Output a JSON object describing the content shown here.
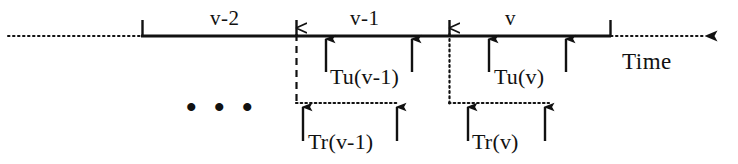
{
  "figure": {
    "axis": {
      "label": "Time",
      "label_x": 622,
      "label_y": 62,
      "baseline_y": 36,
      "solid_start_x": 142,
      "solid_end_x": 610,
      "dotted_left_start_x": 8,
      "dotted_right_end_x": 718,
      "stroke_color": "#111111"
    },
    "ticks": [
      {
        "name": "tick-start",
        "x": 142,
        "top_y": 21,
        "bottom_y": 37
      },
      {
        "name": "tick-v-2-end",
        "x": 296,
        "top_y": 21,
        "bottom_y": 37
      },
      {
        "name": "tick-v-1-end",
        "x": 449,
        "top_y": 21,
        "bottom_y": 37
      },
      {
        "name": "tick-v-end",
        "x": 610,
        "top_y": 21,
        "bottom_y": 37
      }
    ],
    "periods": [
      {
        "name": "period-v-minus-2",
        "label": "v-2",
        "center_x": 232,
        "y": 8
      },
      {
        "name": "period-v-minus-1",
        "label": "v-1",
        "center_x": 372,
        "y": 8
      },
      {
        "name": "period-v",
        "label": "v",
        "center_x": 510,
        "y": 8
      }
    ],
    "ellipsis": {
      "text": "• • •",
      "x": 188,
      "y": 96
    },
    "update_intervals": [
      {
        "name": "tu-v-minus-1",
        "label": "Tu(v-1)",
        "label_x": 330,
        "label_y": 66,
        "arrow_tip_y": 37,
        "arrow_tail_y": 72,
        "arrows_x": [
          326,
          412
        ]
      },
      {
        "name": "tu-v",
        "label": "Tu(v)",
        "label_x": 494,
        "label_y": 66,
        "arrow_tip_y": 37,
        "arrow_tail_y": 72,
        "arrows_x": [
          489,
          566
        ]
      }
    ],
    "read_intervals": [
      {
        "name": "tr-v-minus-1",
        "label": "Tr(v-1)",
        "label_x": 308,
        "label_y": 132,
        "connector_style": "dashed",
        "connector_x": 296,
        "connector_top_y": 30,
        "connector_bottom_y": 103,
        "span_start_x": 296,
        "span_end_x": 399,
        "span_y": 103,
        "arrow_tip_y": 104,
        "arrow_tail_y": 140,
        "arrows_x": [
          303,
          397
        ]
      },
      {
        "name": "tr-v",
        "label": "Tr(v)",
        "label_x": 472,
        "label_y": 132,
        "connector_style": "dotted",
        "connector_x": 449,
        "connector_top_y": 30,
        "connector_bottom_y": 103,
        "span_start_x": 449,
        "span_end_x": 549,
        "span_y": 103,
        "arrow_tip_y": 104,
        "arrow_tail_y": 140,
        "arrows_x": [
          468,
          545
        ]
      }
    ]
  }
}
